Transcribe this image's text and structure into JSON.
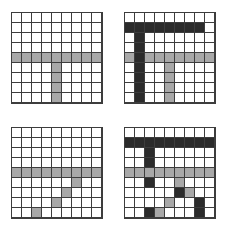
{
  "figure": {
    "title": "",
    "background_color": "#ffffff",
    "layout": "2x2 panel grid of 9x9 cell matrices",
    "grid_line_color": "#3d3d3d",
    "colors": {
      "white": "#ffffff",
      "gray": "#a8a8a8",
      "mid_gray": "#8e8e8e",
      "dark": "#2b2b2b"
    }
  },
  "chart_data": {
    "type": "heatmap",
    "title": "",
    "xlabel": "",
    "ylabel": "",
    "rows": 9,
    "cols": 9,
    "legend": [
      {
        "label": "empty",
        "key": "w",
        "color": "#ffffff"
      },
      {
        "label": "gray",
        "key": "g",
        "color": "#a8a8a8"
      },
      {
        "label": "dark",
        "key": "d",
        "color": "#2b2b2b"
      }
    ],
    "panels": [
      {
        "name": "panel-top-left",
        "position": "top-left",
        "matrix": [
          [
            "w",
            "w",
            "w",
            "w",
            "w",
            "w",
            "w",
            "w",
            "w"
          ],
          [
            "w",
            "w",
            "w",
            "w",
            "w",
            "w",
            "w",
            "w",
            "w"
          ],
          [
            "w",
            "w",
            "w",
            "w",
            "w",
            "w",
            "w",
            "w",
            "w"
          ],
          [
            "w",
            "w",
            "w",
            "w",
            "w",
            "w",
            "w",
            "w",
            "w"
          ],
          [
            "g",
            "g",
            "g",
            "g",
            "g",
            "g",
            "g",
            "g",
            "g"
          ],
          [
            "w",
            "w",
            "w",
            "w",
            "g",
            "w",
            "w",
            "w",
            "w"
          ],
          [
            "w",
            "w",
            "w",
            "w",
            "g",
            "w",
            "w",
            "w",
            "w"
          ],
          [
            "w",
            "w",
            "w",
            "w",
            "g",
            "w",
            "w",
            "w",
            "w"
          ],
          [
            "w",
            "w",
            "w",
            "w",
            "g",
            "w",
            "w",
            "w",
            "w"
          ]
        ]
      },
      {
        "name": "panel-top-right",
        "position": "top-right",
        "matrix": [
          [
            "w",
            "w",
            "w",
            "w",
            "w",
            "w",
            "w",
            "w",
            "w"
          ],
          [
            "d",
            "d",
            "d",
            "d",
            "d",
            "d",
            "d",
            "d",
            "w"
          ],
          [
            "w",
            "d",
            "w",
            "w",
            "w",
            "w",
            "w",
            "w",
            "w"
          ],
          [
            "w",
            "d",
            "w",
            "w",
            "w",
            "w",
            "w",
            "w",
            "w"
          ],
          [
            "g",
            "d",
            "g",
            "g",
            "g",
            "g",
            "g",
            "g",
            "g"
          ],
          [
            "w",
            "d",
            "w",
            "w",
            "g",
            "w",
            "w",
            "w",
            "w"
          ],
          [
            "w",
            "d",
            "w",
            "w",
            "g",
            "w",
            "w",
            "w",
            "w"
          ],
          [
            "w",
            "d",
            "w",
            "w",
            "g",
            "w",
            "w",
            "w",
            "w"
          ],
          [
            "w",
            "d",
            "w",
            "w",
            "g",
            "w",
            "w",
            "w",
            "w"
          ]
        ]
      },
      {
        "name": "panel-bottom-left",
        "position": "bottom-left",
        "matrix": [
          [
            "w",
            "w",
            "w",
            "w",
            "w",
            "w",
            "w",
            "w",
            "w"
          ],
          [
            "w",
            "w",
            "w",
            "w",
            "w",
            "w",
            "w",
            "w",
            "w"
          ],
          [
            "w",
            "w",
            "w",
            "w",
            "w",
            "w",
            "w",
            "w",
            "w"
          ],
          [
            "w",
            "w",
            "w",
            "w",
            "w",
            "w",
            "w",
            "w",
            "w"
          ],
          [
            "g",
            "g",
            "g",
            "g",
            "g",
            "g",
            "g",
            "g",
            "g"
          ],
          [
            "w",
            "w",
            "w",
            "w",
            "w",
            "w",
            "g",
            "w",
            "w"
          ],
          [
            "w",
            "w",
            "w",
            "w",
            "w",
            "g",
            "w",
            "w",
            "w"
          ],
          [
            "w",
            "w",
            "w",
            "w",
            "g",
            "w",
            "w",
            "w",
            "w"
          ],
          [
            "w",
            "w",
            "g",
            "w",
            "w",
            "w",
            "w",
            "w",
            "w"
          ]
        ]
      },
      {
        "name": "panel-bottom-right",
        "position": "bottom-right",
        "matrix": [
          [
            "w",
            "w",
            "w",
            "w",
            "w",
            "w",
            "w",
            "w",
            "w"
          ],
          [
            "d",
            "d",
            "d",
            "d",
            "d",
            "d",
            "d",
            "d",
            "d"
          ],
          [
            "w",
            "w",
            "d",
            "w",
            "w",
            "w",
            "w",
            "w",
            "w"
          ],
          [
            "w",
            "w",
            "d",
            "w",
            "w",
            "w",
            "w",
            "w",
            "w"
          ],
          [
            "g",
            "g",
            "g",
            "g",
            "g",
            "g",
            "g",
            "g",
            "g"
          ],
          [
            "w",
            "w",
            "d",
            "w",
            "w",
            "g",
            "w",
            "w",
            "w"
          ],
          [
            "w",
            "w",
            "w",
            "w",
            "w",
            "d",
            "g",
            "w",
            "w"
          ],
          [
            "w",
            "w",
            "w",
            "w",
            "g",
            "w",
            "w",
            "d",
            "w"
          ],
          [
            "w",
            "w",
            "d",
            "g",
            "w",
            "w",
            "w",
            "d",
            "w"
          ]
        ]
      }
    ]
  }
}
